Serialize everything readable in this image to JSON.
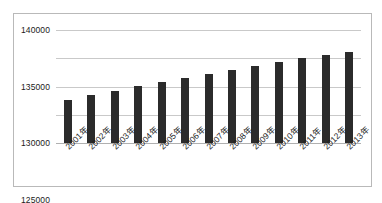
{
  "chart_data": {
    "type": "bar",
    "title": "",
    "xlabel": "",
    "ylabel": "",
    "categories": [
      "2001年",
      "2002年",
      "2003年",
      "2004年",
      "2005年",
      "2006年",
      "2007年",
      "2008年",
      "2009年",
      "2010年",
      "2011年",
      "2012年",
      "2013年"
    ],
    "values": [
      127600,
      128500,
      129200,
      130100,
      130800,
      131500,
      132200,
      132900,
      133600,
      134300,
      135000,
      135600,
      136100
    ],
    "ylim": [
      120000,
      140000
    ],
    "yticks": [
      120000,
      125000,
      130000,
      135000,
      140000
    ],
    "ytick_labels": [
      "120000",
      "125000",
      "130000",
      "135000",
      "140000"
    ],
    "grid": true,
    "legend": false,
    "series_color": "#2b2b2b",
    "gridline_color": "#c9c9c9",
    "plot_background": "#ffffff",
    "border_color": "#b9b9b9"
  }
}
